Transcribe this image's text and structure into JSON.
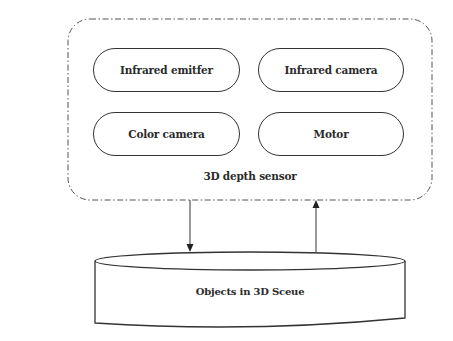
{
  "diagram": {
    "container": {
      "label": "3D depth sensor",
      "border_style": "dash-dot",
      "border_color": "#555555"
    },
    "components": [
      {
        "id": "infrared-emitter",
        "label": "Infrared emitfer"
      },
      {
        "id": "infrared-camera",
        "label": "Infrared camera"
      },
      {
        "id": "color-camera",
        "label": "Color camera"
      },
      {
        "id": "motor",
        "label": "Motor"
      }
    ],
    "target": {
      "label": "Objects in 3D Sceue",
      "shape": "cylinder"
    },
    "connections": [
      {
        "from": "3D depth sensor",
        "to": "Objects in 3D Sceue",
        "direction": "down"
      },
      {
        "from": "Objects in 3D Sceue",
        "to": "3D depth sensor",
        "direction": "up"
      }
    ],
    "colors": {
      "stroke": "#333333",
      "text": "#2b2b2b",
      "background": "#ffffff",
      "faint_background_text": "#e2e2e2"
    }
  }
}
